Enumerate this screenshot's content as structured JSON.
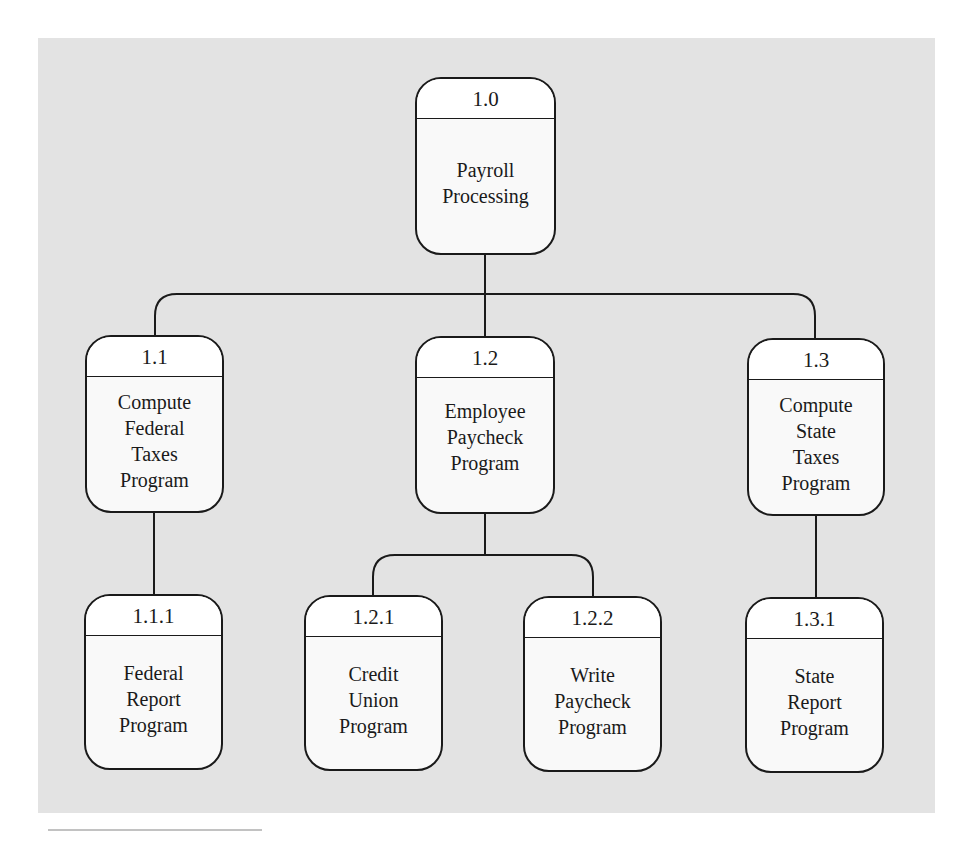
{
  "diagram": {
    "type": "hierarchy-chart",
    "colors": {
      "background_panel": "#e3e3e3",
      "box_header": "#ffffff",
      "box_body": "#f9f9f9",
      "stroke": "#1a1a1a"
    },
    "nodes": [
      {
        "id": "1.0",
        "number": "1.0",
        "label": [
          "Payroll",
          "Processing"
        ],
        "parent": null
      },
      {
        "id": "1.1",
        "number": "1.1",
        "label": [
          "Compute",
          "Federal",
          "Taxes",
          "Program"
        ],
        "parent": "1.0"
      },
      {
        "id": "1.2",
        "number": "1.2",
        "label": [
          "Employee",
          "Paycheck",
          "Program"
        ],
        "parent": "1.0"
      },
      {
        "id": "1.3",
        "number": "1.3",
        "label": [
          "Compute",
          "State",
          "Taxes",
          "Program"
        ],
        "parent": "1.0"
      },
      {
        "id": "1.1.1",
        "number": "1.1.1",
        "label": [
          "Federal",
          "Report",
          "Program"
        ],
        "parent": "1.1"
      },
      {
        "id": "1.2.1",
        "number": "1.2.1",
        "label": [
          "Credit",
          "Union",
          "Program"
        ],
        "parent": "1.2"
      },
      {
        "id": "1.2.2",
        "number": "1.2.2",
        "label": [
          "Write",
          "Paycheck",
          "Program"
        ],
        "parent": "1.2"
      },
      {
        "id": "1.3.1",
        "number": "1.3.1",
        "label": [
          "State",
          "Report",
          "Program"
        ],
        "parent": "1.3"
      }
    ],
    "edges": [
      {
        "from": "1.0",
        "to": "1.1"
      },
      {
        "from": "1.0",
        "to": "1.2"
      },
      {
        "from": "1.0",
        "to": "1.3"
      },
      {
        "from": "1.1",
        "to": "1.1.1"
      },
      {
        "from": "1.2",
        "to": "1.2.1"
      },
      {
        "from": "1.2",
        "to": "1.2.2"
      },
      {
        "from": "1.3",
        "to": "1.3.1"
      }
    ]
  }
}
